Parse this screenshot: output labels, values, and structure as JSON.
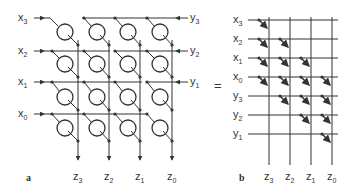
{
  "figure": {
    "panel_a": {
      "label": "a",
      "inputs_left": [
        {
          "base": "x",
          "sub": "3"
        },
        {
          "base": "x",
          "sub": "2"
        },
        {
          "base": "x",
          "sub": "1"
        },
        {
          "base": "x",
          "sub": "0"
        }
      ],
      "inputs_right": [
        {
          "base": "y",
          "sub": "3"
        },
        {
          "base": "y",
          "sub": "2"
        },
        {
          "base": "y",
          "sub": "1"
        }
      ],
      "outputs": [
        {
          "base": "z",
          "sub": "3"
        },
        {
          "base": "z",
          "sub": "2"
        },
        {
          "base": "z",
          "sub": "1"
        },
        {
          "base": "z",
          "sub": "0"
        }
      ],
      "cell_grid": {
        "rows": 4,
        "cols": 4
      }
    },
    "equals": "=",
    "panel_b": {
      "label": "b",
      "row_labels": [
        {
          "base": "x",
          "sub": "3"
        },
        {
          "base": "x",
          "sub": "2"
        },
        {
          "base": "x",
          "sub": "1"
        },
        {
          "base": "x",
          "sub": "0"
        },
        {
          "base": "y",
          "sub": "3"
        },
        {
          "base": "y",
          "sub": "2"
        },
        {
          "base": "y",
          "sub": "1"
        }
      ],
      "outputs": [
        {
          "base": "z",
          "sub": "3"
        },
        {
          "base": "z",
          "sub": "2"
        },
        {
          "base": "z",
          "sub": "1"
        },
        {
          "base": "z",
          "sub": "0"
        }
      ],
      "switches": [
        [
          0,
          0
        ],
        [
          1,
          0
        ],
        [
          1,
          1
        ],
        [
          2,
          0
        ],
        [
          2,
          1
        ],
        [
          2,
          2
        ],
        [
          3,
          0
        ],
        [
          3,
          1
        ],
        [
          3,
          2
        ],
        [
          3,
          3
        ],
        [
          4,
          1
        ],
        [
          4,
          2
        ],
        [
          4,
          3
        ],
        [
          5,
          2
        ],
        [
          5,
          3
        ],
        [
          6,
          3
        ]
      ]
    }
  }
}
